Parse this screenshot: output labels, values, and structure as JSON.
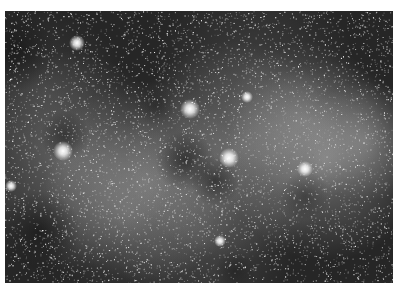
{
  "image": {
    "subject": "Milky Way star field photograph",
    "style": "grayscale",
    "background_color": "#ffffff",
    "sky_dark_color": "#1e1e1e",
    "sky_bright_color": "#d8d8d8",
    "bright_stars": [
      {
        "name": "star-upper-left"
      },
      {
        "name": "star-center"
      },
      {
        "name": "star-left-mid"
      },
      {
        "name": "star-right-center"
      },
      {
        "name": "star-right"
      },
      {
        "name": "star-far-left"
      },
      {
        "name": "star-lower-center"
      },
      {
        "name": "star-upper-mid"
      }
    ]
  }
}
